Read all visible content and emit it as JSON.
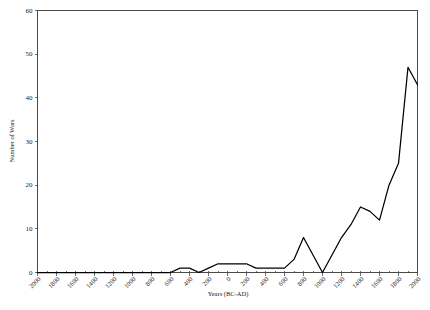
{
  "chart_data": {
    "type": "line",
    "title": "",
    "xlabel": "Years (BC-AD)",
    "ylabel": "Number of Wars",
    "xlim": [
      -2000,
      2000
    ],
    "ylim": [
      0,
      60
    ],
    "grid": false,
    "legend": null,
    "y_ticks": [
      0,
      10,
      20,
      30,
      40,
      50,
      60
    ],
    "y_tick_labels": [
      "0",
      "10",
      "20",
      "30",
      "40",
      "50",
      "60"
    ],
    "x_ticks": [
      -2000,
      -1800,
      -1600,
      -1400,
      -1200,
      -1000,
      -800,
      -600,
      -400,
      -200,
      0,
      200,
      400,
      600,
      800,
      1000,
      1200,
      1400,
      1600,
      1800,
      2000
    ],
    "x_tick_labels": [
      "2000",
      "1800",
      "1600",
      "1400",
      "1200",
      "1000",
      "800",
      "600",
      "400",
      "200",
      "0",
      "200",
      "400",
      "600",
      "800",
      "1000",
      "1200",
      "1400",
      "1600",
      "1800",
      "2000"
    ],
    "x_minor_tick_step": 100,
    "series": [
      {
        "name": "Number of Wars",
        "color": "#000000",
        "x": [
          -2000,
          -1900,
          -1800,
          -1700,
          -1600,
          -1500,
          -1400,
          -1300,
          -1200,
          -1100,
          -1000,
          -900,
          -800,
          -700,
          -600,
          -500,
          -400,
          -300,
          -200,
          -100,
          0,
          100,
          200,
          300,
          400,
          500,
          600,
          700,
          800,
          900,
          1000,
          1100,
          1200,
          1300,
          1400,
          1500,
          1600,
          1700,
          1800,
          1900,
          2000
        ],
        "y": [
          0,
          0,
          0,
          0,
          0,
          0,
          0,
          0,
          0,
          0,
          0,
          0,
          0,
          0,
          0,
          1,
          1,
          0,
          1,
          2,
          2,
          2,
          2,
          1,
          1,
          1,
          1,
          3,
          8,
          4,
          0,
          4,
          8,
          11,
          15,
          14,
          12,
          20,
          25,
          47,
          43
        ]
      }
    ]
  },
  "axes": {
    "y_axis_title": "Number of Wars",
    "x_axis_title": "Years (BC-AD)"
  }
}
